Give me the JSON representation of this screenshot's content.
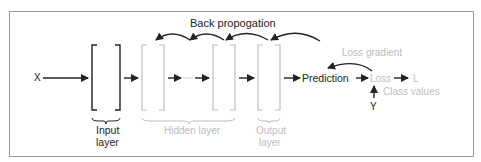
{
  "diagram": {
    "type": "neural-network-backpropagation",
    "colors": {
      "dark": "#222222",
      "gray": "#bdbdbd",
      "frame": "#999999",
      "background": "#ffffff"
    },
    "labels": {
      "input_x": "X",
      "back_propagation": "Back propogation",
      "loss_gradient": "Loss gradient",
      "prediction": "Prediction",
      "loss": "Loss",
      "loss_symbol": "L",
      "class_values": "Class values",
      "class_symbol": "Y",
      "input_layer_line1": "Input",
      "input_layer_line2": "layer",
      "hidden_layer": "Hidden layer",
      "output_layer_line1": "Output",
      "output_layer_line2": "layer"
    },
    "layers": [
      {
        "name": "input-layer",
        "style": "dark"
      },
      {
        "name": "hidden-layer-1",
        "style": "gray"
      },
      {
        "name": "hidden-layer-2",
        "style": "gray"
      },
      {
        "name": "output-layer",
        "style": "gray"
      }
    ]
  }
}
